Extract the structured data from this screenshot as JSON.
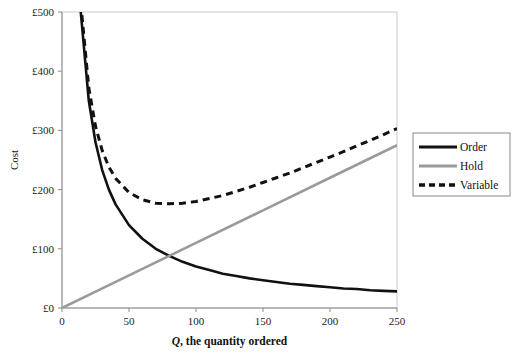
{
  "chart_data": {
    "type": "line",
    "title": "",
    "subtitle": "",
    "xlabel": "Q, the quantity ordered",
    "xlabel_italic_prefix": "Q",
    "xlabel_rest": ", the quantity ordered",
    "ylabel": "Cost",
    "xlim": [
      0,
      250
    ],
    "ylim": [
      0,
      500
    ],
    "xticks": [
      0,
      50,
      100,
      150,
      200,
      250
    ],
    "xtick_labels": [
      "0",
      "50",
      "100",
      "150",
      "200",
      "250"
    ],
    "yticks": [
      0,
      100,
      200,
      300,
      400,
      500
    ],
    "ytick_labels": [
      "£0",
      "£100",
      "£200",
      "£300",
      "£400",
      "£500"
    ],
    "grid": false,
    "legend_position": "right-outside",
    "currency_symbol": "£",
    "model": {
      "order_cost_numerator": 7000,
      "hold_cost_slope": 1.1,
      "eoq_quantity": 80,
      "eoq_total_cost": 176,
      "crossing_point": {
        "q": 80,
        "cost": 88
      }
    },
    "series": [
      {
        "name": "Order",
        "color": "#111111",
        "style": "solid",
        "width": 2.6,
        "formula": "7000 / Q",
        "x": [
          14,
          20,
          25,
          30,
          35,
          40,
          50,
          60,
          70,
          80,
          90,
          100,
          110,
          120,
          130,
          140,
          150,
          160,
          170,
          180,
          190,
          200,
          210,
          220,
          230,
          240,
          250
        ],
        "values": [
          500,
          350,
          280,
          233,
          200,
          175,
          140,
          117,
          100,
          88,
          78,
          70,
          64,
          58,
          54,
          50,
          47,
          44,
          41,
          39,
          37,
          35,
          33,
          32,
          30,
          29,
          28
        ]
      },
      {
        "name": "Hold",
        "color": "#9a9a9a",
        "style": "solid",
        "width": 2.6,
        "formula": "1.1 * Q",
        "x": [
          0,
          50,
          100,
          150,
          200,
          250
        ],
        "values": [
          0,
          55,
          110,
          165,
          220,
          275
        ]
      },
      {
        "name": "Variable",
        "color": "#111111",
        "style": "dashed",
        "width": 3.0,
        "formula": "7000 / Q + 1.1 * Q",
        "x": [
          14,
          20,
          25,
          30,
          35,
          40,
          50,
          60,
          70,
          80,
          90,
          100,
          110,
          120,
          130,
          140,
          150,
          160,
          170,
          180,
          190,
          200,
          210,
          220,
          230,
          240,
          250
        ],
        "values": [
          515,
          372,
          307,
          266,
          238,
          219,
          195,
          183,
          177,
          176,
          177,
          180,
          185,
          190,
          197,
          204,
          212,
          220,
          228,
          237,
          246,
          255,
          264,
          274,
          283,
          293,
          303
        ]
      }
    ],
    "legend_entries": [
      {
        "label": "Order",
        "color": "#111111",
        "style": "solid"
      },
      {
        "label": "Hold",
        "color": "#9a9a9a",
        "style": "solid"
      },
      {
        "label": "Variable",
        "color": "#111111",
        "style": "dashed"
      }
    ]
  }
}
